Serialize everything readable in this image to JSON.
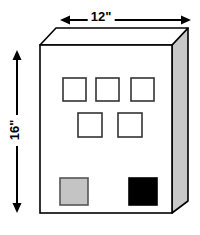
{
  "figure": {
    "background_color": "#ffffff",
    "stroke_color": "#000000",
    "front_face_color": "#ffffff",
    "top_face_color": "#ffffff",
    "side_face_color": "#c8c8c8",
    "dimensions": {
      "width": {
        "label": "12\"",
        "value": 12,
        "unit": "inches",
        "orientation": "horizontal",
        "position": "top"
      },
      "height": {
        "label": "16\"",
        "value": 16,
        "unit": "inches",
        "orientation": "vertical",
        "position": "left"
      }
    },
    "openings": {
      "outline_color": "#333333",
      "row_1": [
        {
          "name": "opening-1",
          "fill": "#ffffff"
        },
        {
          "name": "opening-2",
          "fill": "#ffffff"
        },
        {
          "name": "opening-3",
          "fill": "#ffffff"
        }
      ],
      "row_2": [
        {
          "name": "opening-4",
          "fill": "#ffffff"
        },
        {
          "name": "opening-5",
          "fill": "#ffffff"
        }
      ],
      "row_3": [
        {
          "name": "opening-grey",
          "fill": "#c4c4c4"
        },
        {
          "name": "opening-black",
          "fill": "#000000"
        }
      ]
    }
  }
}
